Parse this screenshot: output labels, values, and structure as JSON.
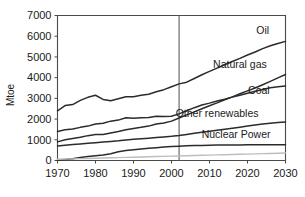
{
  "chart_data": {
    "type": "line",
    "title": "",
    "xlabel": "",
    "ylabel": "Mtoe",
    "xlim": [
      1970,
      2030
    ],
    "ylim": [
      0,
      7000
    ],
    "grid": false,
    "legend_position": "inline-right",
    "x_ticks": [
      "1970",
      "1980",
      "1990",
      "2000",
      "2010",
      "2020",
      "2030"
    ],
    "x_tick_values": [
      1970,
      1980,
      1990,
      2000,
      2010,
      2020,
      2030
    ],
    "y_ticks": [
      "0",
      "1000",
      "2000",
      "3000",
      "4000",
      "5000",
      "6000",
      "7000"
    ],
    "y_tick_values": [
      0,
      1000,
      2000,
      3000,
      4000,
      5000,
      6000,
      7000
    ],
    "annotations": [
      {
        "name": "history-projection-divider",
        "type": "vline",
        "x": 2002,
        "label": ""
      }
    ],
    "x": [
      1970,
      1972,
      1974,
      1976,
      1978,
      1980,
      1982,
      1984,
      1986,
      1988,
      1990,
      1992,
      1994,
      1996,
      1998,
      2000,
      2002,
      2004,
      2006,
      2008,
      2010,
      2012,
      2014,
      2016,
      2018,
      2020,
      2022,
      2024,
      2026,
      2028,
      2030
    ],
    "series": [
      {
        "name": "Oil",
        "color": "#2b2b2b",
        "label_x": 2024,
        "label_y": 6100,
        "values": [
          2400,
          2650,
          2700,
          2900,
          3050,
          3150,
          2950,
          2880,
          2980,
          3080,
          3080,
          3150,
          3200,
          3320,
          3420,
          3560,
          3700,
          3780,
          3960,
          4140,
          4300,
          4460,
          4620,
          4780,
          4930,
          5090,
          5240,
          5400,
          5540,
          5650,
          5750
        ]
      },
      {
        "name": "Natural gas",
        "color": "#2b2b2b",
        "label_x": 2018,
        "label_y": 4450,
        "values": [
          900,
          1000,
          1060,
          1120,
          1200,
          1250,
          1260,
          1330,
          1400,
          1480,
          1550,
          1600,
          1660,
          1760,
          1810,
          1900,
          2050,
          2200,
          2350,
          2500,
          2640,
          2780,
          2930,
          3070,
          3220,
          3360,
          3500,
          3660,
          3820,
          3990,
          4150
        ]
      },
      {
        "name": "Coal",
        "color": "#2b2b2b",
        "label_x": 2023,
        "label_y": 3200,
        "values": [
          1400,
          1480,
          1520,
          1600,
          1660,
          1760,
          1800,
          1900,
          1950,
          2060,
          2040,
          2060,
          2080,
          2140,
          2120,
          2140,
          2250,
          2400,
          2550,
          2680,
          2770,
          2870,
          2960,
          3060,
          3150,
          3250,
          3340,
          3430,
          3510,
          3560,
          3600
        ]
      },
      {
        "name": "Other renewables",
        "color": "#2b2b2b",
        "label_x": 2012,
        "label_y": 2100,
        "values": [
          700,
          740,
          770,
          800,
          830,
          860,
          890,
          920,
          950,
          990,
          1020,
          1050,
          1080,
          1110,
          1140,
          1170,
          1210,
          1260,
          1310,
          1360,
          1410,
          1460,
          1510,
          1560,
          1610,
          1660,
          1710,
          1760,
          1800,
          1830,
          1860
        ]
      },
      {
        "name": "Nuclear Power",
        "color": "#2b2b2b",
        "label_x": 2017,
        "label_y": 1100,
        "values": [
          20,
          50,
          90,
          140,
          190,
          230,
          270,
          330,
          420,
          480,
          520,
          560,
          590,
          620,
          650,
          670,
          690,
          710,
          720,
          730,
          740,
          745,
          750,
          752,
          754,
          756,
          758,
          760,
          760,
          760,
          760
        ]
      },
      {
        "name": "Renewables baseline",
        "color": "#bdbdbd",
        "label_x": null,
        "label_y": null,
        "values": [
          60,
          70,
          80,
          90,
          100,
          110,
          120,
          130,
          140,
          150,
          160,
          170,
          180,
          190,
          200,
          210,
          220,
          230,
          240,
          250,
          260,
          270,
          280,
          290,
          300,
          310,
          320,
          330,
          340,
          350,
          360
        ]
      }
    ]
  }
}
